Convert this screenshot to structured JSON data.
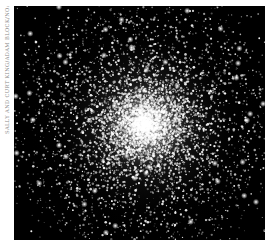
{
  "image": {
    "subject": "globular star cluster",
    "description": "Dense spherical cluster of white stars, bright core near center, fading into scattered stars on black sky",
    "background_color": "#000000",
    "star_color": "#ffffff",
    "core_center": {
      "x": 131,
      "y": 119
    },
    "core_radius": 38,
    "halo_radius": 120
  },
  "credit": {
    "text": "SALLY AND CURT KING/ADAM BLOCK/NOAO/AURA/NSF",
    "orientation": "vertical, bottom-to-top",
    "color": "#8a8a8a"
  }
}
